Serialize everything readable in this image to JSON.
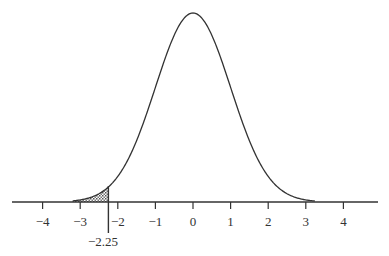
{
  "chart_data": {
    "type": "area",
    "title": "",
    "xlabel": "",
    "ylabel": "",
    "x_ticks": [
      -4,
      -3,
      -2,
      -1,
      0,
      1,
      2,
      3,
      4
    ],
    "x_tick_labels": [
      "−4",
      "−3",
      "−2",
      "−1",
      "0",
      "1",
      "2",
      "3",
      "4"
    ],
    "xlim": [
      -4.9,
      4.6
    ],
    "curve": {
      "distribution": "normal",
      "mean": 0,
      "sd": 1
    },
    "shaded_region": {
      "from": -3.2,
      "to": -2.25,
      "pattern": "crosshatch"
    },
    "annotation": {
      "x": -2.25,
      "label": "−2.25"
    },
    "grid": false,
    "legend": null
  },
  "labels": {
    "annotation": "−2.25",
    "ticks": [
      "−4",
      "−3",
      "−2",
      "−1",
      "0",
      "1",
      "2",
      "3",
      "4"
    ]
  }
}
